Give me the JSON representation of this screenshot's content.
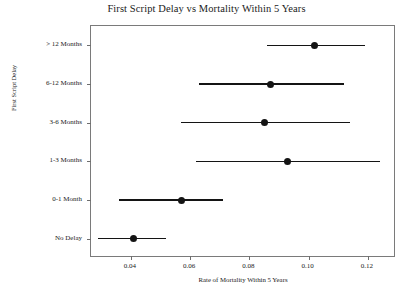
{
  "chart_data": {
    "type": "scatter",
    "title": "First Script Delay vs Mortality Within 5 Years",
    "xlabel": "Rate of Mortality Within 5 Years",
    "ylabel": "First Script Delay",
    "orientation": "horizontal",
    "grid": false,
    "legend": false,
    "xlim": [
      0.0265,
      0.1295
    ],
    "xticks": [
      0.04,
      0.06,
      0.08,
      0.1,
      0.12
    ],
    "xtick_labels": [
      "0.04",
      "0.06",
      "0.08",
      "0.10",
      "0.12"
    ],
    "categories": [
      "No Delay",
      "0-1 Month",
      "1-3 Months",
      "3-6 Months",
      "6-12 Months",
      "> 12 Months"
    ],
    "values": [
      0.041,
      0.057,
      0.093,
      0.085,
      0.087,
      0.102
    ],
    "ci_low": [
      0.029,
      0.036,
      0.062,
      0.057,
      0.063,
      0.086
    ],
    "ci_high": [
      0.052,
      0.071,
      0.124,
      0.114,
      0.112,
      0.119
    ],
    "marker_color": "#141414",
    "line_color": "#141414",
    "points": [
      {
        "category": "> 12 Months",
        "value": 0.102,
        "ci_low": 0.086,
        "ci_high": 0.119
      },
      {
        "category": "6-12 Months",
        "value": 0.087,
        "ci_low": 0.063,
        "ci_high": 0.112
      },
      {
        "category": "3-6 Months",
        "value": 0.085,
        "ci_low": 0.057,
        "ci_high": 0.114
      },
      {
        "category": "1-3 Months",
        "value": 0.093,
        "ci_low": 0.062,
        "ci_high": 0.124
      },
      {
        "category": "0-1 Month",
        "value": 0.057,
        "ci_low": 0.036,
        "ci_high": 0.071
      },
      {
        "category": "No Delay",
        "value": 0.041,
        "ci_low": 0.029,
        "ci_high": 0.052
      }
    ]
  },
  "axis": {
    "y_categories_top_to_bottom": [
      "> 12 Months",
      "6-12 Months",
      "3-6 Months",
      "1-3 Months",
      "0-1 Month",
      "No Delay"
    ],
    "x_tick_labels": [
      "0.04",
      "0.06",
      "0.08",
      "0.10",
      "0.12"
    ]
  }
}
